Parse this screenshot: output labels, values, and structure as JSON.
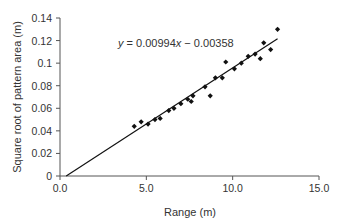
{
  "chart_data": {
    "type": "scatter",
    "title": "",
    "xlabel": "Range (m)",
    "ylabel": "Square root of pattern area (m)",
    "xlim": [
      0,
      15
    ],
    "ylim": [
      0,
      0.14
    ],
    "xticks": [
      0,
      5,
      10,
      15
    ],
    "xtick_labels": [
      "0.0",
      "5.0",
      "10.0",
      "15.0"
    ],
    "yticks": [
      0,
      0.02,
      0.04,
      0.06,
      0.08,
      0.1,
      0.12,
      0.14
    ],
    "ytick_labels": [
      "0",
      "0.02",
      "0.04",
      "0.06",
      "0.08",
      "0.1",
      "0.12",
      "0.14"
    ],
    "grid": false,
    "legend": null,
    "annotation": "y = 0.00994x − 0.00358",
    "series": [
      {
        "name": "Measurements",
        "marker": "diamond",
        "color": "#111111",
        "points": [
          [
            4.3,
            0.044
          ],
          [
            4.7,
            0.048
          ],
          [
            5.1,
            0.046
          ],
          [
            5.5,
            0.05
          ],
          [
            5.8,
            0.051
          ],
          [
            6.3,
            0.058
          ],
          [
            6.6,
            0.06
          ],
          [
            7.0,
            0.064
          ],
          [
            7.4,
            0.068
          ],
          [
            7.6,
            0.066
          ],
          [
            7.7,
            0.071
          ],
          [
            8.4,
            0.079
          ],
          [
            8.7,
            0.071
          ],
          [
            9.0,
            0.087
          ],
          [
            9.4,
            0.087
          ],
          [
            9.6,
            0.101
          ],
          [
            10.1,
            0.095
          ],
          [
            10.5,
            0.1
          ],
          [
            10.9,
            0.106
          ],
          [
            11.3,
            0.108
          ],
          [
            11.6,
            0.104
          ],
          [
            11.8,
            0.118
          ],
          [
            12.2,
            0.112
          ],
          [
            12.6,
            0.13
          ]
        ]
      },
      {
        "name": "Linear fit",
        "type": "line",
        "color": "#111111",
        "slope": 0.00994,
        "intercept": -0.00358,
        "x_range": [
          0.36,
          12.6
        ]
      }
    ]
  },
  "labels": {
    "equation_prefix": "y",
    "equation_body": " = 0.00994",
    "equation_x": "x",
    "equation_suffix": " − 0.00358",
    "xlabel": "Range (m)",
    "ylabel": "Square root of pattern area (m)"
  }
}
